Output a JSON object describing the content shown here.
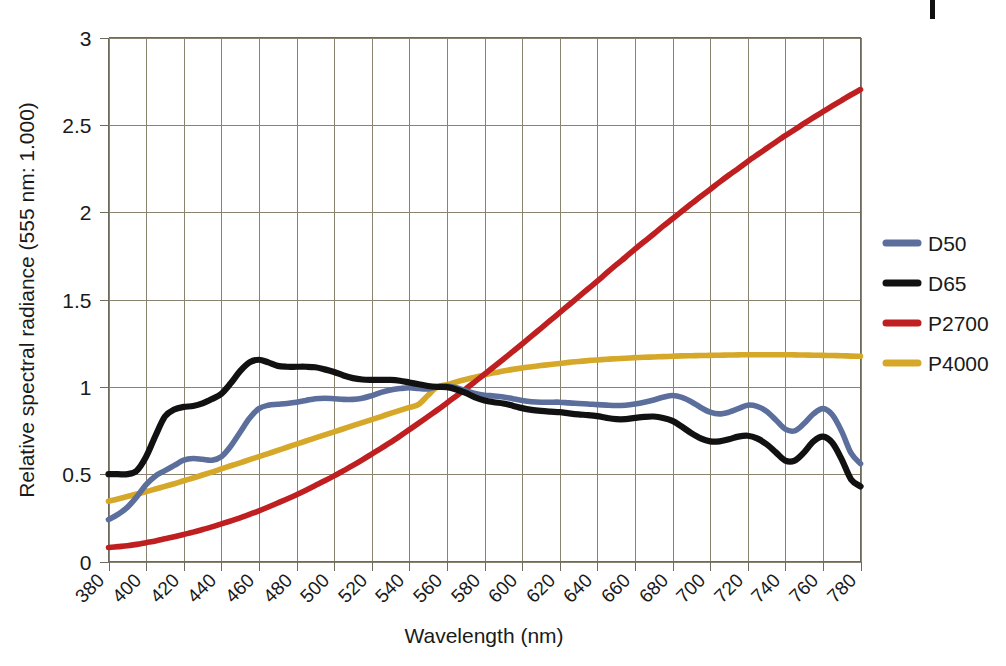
{
  "chart_data": {
    "type": "line",
    "title": "",
    "xlabel": "Wavelength (nm)",
    "ylabel": "Relative spectral radiance (555 nm: 1.000)",
    "xlim": [
      380,
      780
    ],
    "ylim": [
      0,
      3
    ],
    "grid": true,
    "legend_position": "right",
    "xticks": [
      380,
      400,
      420,
      440,
      460,
      480,
      500,
      520,
      540,
      560,
      580,
      600,
      620,
      640,
      660,
      680,
      700,
      720,
      740,
      760,
      780
    ],
    "xtick_labels": [
      "380",
      "400",
      "420",
      "440",
      "460",
      "480",
      "500",
      "520",
      "540",
      "560",
      "580",
      "600",
      "620",
      "640",
      "660",
      "680",
      "700",
      "720",
      "740",
      "760",
      "780"
    ],
    "yticks": [
      0,
      0.5,
      1,
      1.5,
      2,
      2.5,
      3
    ],
    "ytick_labels": [
      "0",
      "0.5",
      "1",
      "1.5",
      "2",
      "2.5",
      "3"
    ],
    "x": [
      380,
      385,
      390,
      395,
      400,
      405,
      410,
      415,
      420,
      425,
      430,
      435,
      440,
      445,
      450,
      455,
      460,
      465,
      470,
      475,
      480,
      485,
      490,
      495,
      500,
      505,
      510,
      515,
      520,
      525,
      530,
      535,
      540,
      545,
      550,
      555,
      560,
      565,
      570,
      575,
      580,
      585,
      590,
      595,
      600,
      605,
      610,
      615,
      620,
      625,
      630,
      635,
      640,
      645,
      650,
      655,
      660,
      665,
      670,
      675,
      680,
      685,
      690,
      695,
      700,
      705,
      710,
      715,
      720,
      725,
      730,
      735,
      740,
      745,
      750,
      755,
      760,
      765,
      770,
      775,
      780
    ],
    "series": [
      {
        "name": "D50",
        "color": "#5b6e9c",
        "values": [
          0.24,
          0.27,
          0.31,
          0.37,
          0.44,
          0.49,
          0.52,
          0.55,
          0.58,
          0.59,
          0.585,
          0.58,
          0.6,
          0.66,
          0.74,
          0.82,
          0.875,
          0.895,
          0.9,
          0.905,
          0.912,
          0.922,
          0.932,
          0.935,
          0.932,
          0.928,
          0.928,
          0.935,
          0.95,
          0.968,
          0.982,
          0.99,
          0.995,
          0.99,
          0.988,
          1.0,
          1.005,
          0.995,
          0.978,
          0.962,
          0.952,
          0.948,
          0.942,
          0.932,
          0.922,
          0.915,
          0.912,
          0.912,
          0.912,
          0.908,
          0.905,
          0.902,
          0.898,
          0.895,
          0.893,
          0.895,
          0.902,
          0.912,
          0.925,
          0.94,
          0.95,
          0.94,
          0.915,
          0.882,
          0.855,
          0.845,
          0.855,
          0.875,
          0.895,
          0.888,
          0.86,
          0.81,
          0.758,
          0.748,
          0.79,
          0.845,
          0.875,
          0.84,
          0.745,
          0.62,
          0.56
        ]
      },
      {
        "name": "D65",
        "color": "#111111",
        "values": [
          0.5,
          0.5,
          0.5,
          0.52,
          0.6,
          0.72,
          0.83,
          0.87,
          0.885,
          0.89,
          0.905,
          0.93,
          0.96,
          1.02,
          1.09,
          1.14,
          1.155,
          1.14,
          1.12,
          1.115,
          1.115,
          1.115,
          1.112,
          1.1,
          1.085,
          1.065,
          1.05,
          1.042,
          1.04,
          1.04,
          1.04,
          1.035,
          1.025,
          1.015,
          1.005,
          1.0,
          0.998,
          0.985,
          0.965,
          0.94,
          0.922,
          0.912,
          0.905,
          0.892,
          0.878,
          0.868,
          0.862,
          0.858,
          0.855,
          0.848,
          0.842,
          0.838,
          0.832,
          0.822,
          0.815,
          0.815,
          0.822,
          0.828,
          0.83,
          0.822,
          0.805,
          0.772,
          0.735,
          0.705,
          0.688,
          0.688,
          0.7,
          0.715,
          0.72,
          0.705,
          0.672,
          0.625,
          0.578,
          0.578,
          0.625,
          0.688,
          0.715,
          0.68,
          0.585,
          0.47,
          0.43
        ]
      },
      {
        "name": "P2700",
        "color": "#bf1f20",
        "values": [
          0.08,
          0.085,
          0.09,
          0.098,
          0.108,
          0.118,
          0.13,
          0.142,
          0.155,
          0.168,
          0.183,
          0.198,
          0.215,
          0.232,
          0.25,
          0.27,
          0.29,
          0.312,
          0.335,
          0.358,
          0.382,
          0.408,
          0.435,
          0.462,
          0.49,
          0.52,
          0.55,
          0.582,
          0.615,
          0.648,
          0.682,
          0.718,
          0.755,
          0.792,
          0.83,
          0.868,
          0.908,
          0.948,
          0.988,
          1.03,
          1.072,
          1.115,
          1.158,
          1.202,
          1.245,
          1.29,
          1.335,
          1.38,
          1.425,
          1.47,
          1.515,
          1.56,
          1.605,
          1.652,
          1.698,
          1.742,
          1.788,
          1.832,
          1.875,
          1.92,
          1.962,
          2.005,
          2.048,
          2.09,
          2.13,
          2.172,
          2.212,
          2.25,
          2.29,
          2.328,
          2.365,
          2.402,
          2.438,
          2.472,
          2.508,
          2.542,
          2.575,
          2.608,
          2.64,
          2.672,
          2.702
        ]
      },
      {
        "name": "P4000",
        "color": "#d6a829",
        "values": [
          0.345,
          0.358,
          0.372,
          0.386,
          0.4,
          0.415,
          0.43,
          0.445,
          0.462,
          0.478,
          0.495,
          0.512,
          0.53,
          0.548,
          0.565,
          0.583,
          0.6,
          0.618,
          0.636,
          0.654,
          0.672,
          0.69,
          0.708,
          0.725,
          0.742,
          0.76,
          0.778,
          0.795,
          0.812,
          0.83,
          0.848,
          0.865,
          0.882,
          0.9,
          0.952,
          1.0,
          1.012,
          1.028,
          1.042,
          1.055,
          1.068,
          1.08,
          1.09,
          1.1,
          1.108,
          1.115,
          1.122,
          1.128,
          1.134,
          1.14,
          1.145,
          1.15,
          1.154,
          1.158,
          1.161,
          1.164,
          1.167,
          1.169,
          1.171,
          1.173,
          1.175,
          1.177,
          1.178,
          1.179,
          1.18,
          1.181,
          1.182,
          1.183,
          1.184,
          1.184,
          1.184,
          1.184,
          1.184,
          1.183,
          1.182,
          1.181,
          1.18,
          1.179,
          1.178,
          1.176,
          1.175
        ]
      }
    ]
  },
  "legend": {
    "entries": [
      {
        "label": "D50",
        "color": "#5b6e9c"
      },
      {
        "label": "D65",
        "color": "#111111"
      },
      {
        "label": "P2700",
        "color": "#bf1f20"
      },
      {
        "label": "P4000",
        "color": "#d6a829"
      }
    ]
  }
}
